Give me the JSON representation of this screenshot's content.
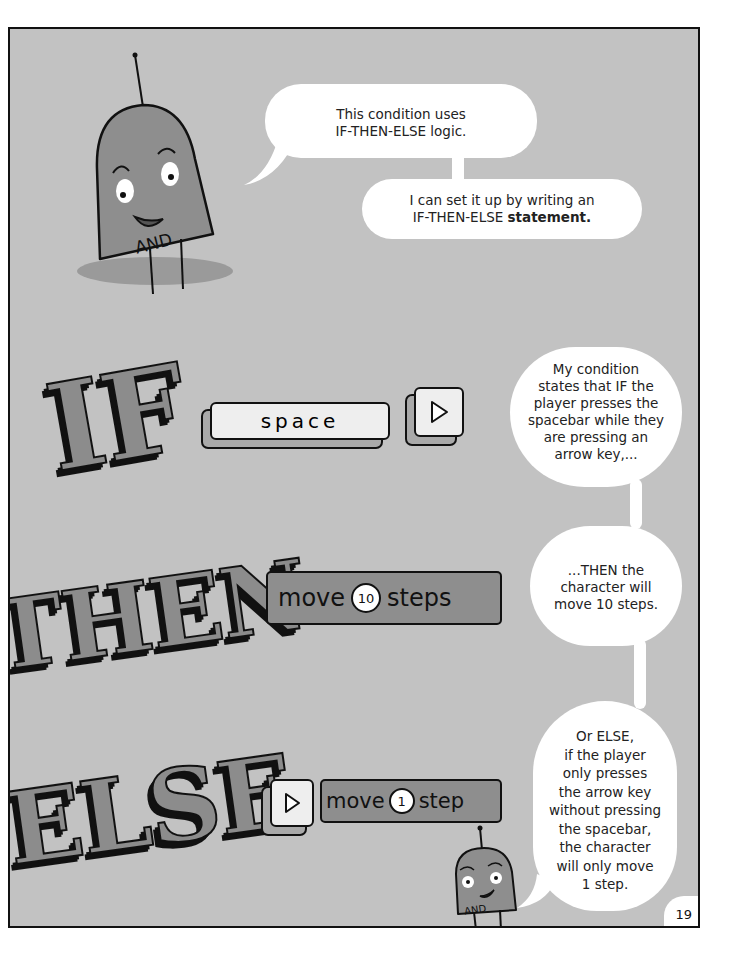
{
  "page": {
    "number": "19",
    "colors": {
      "panel_bg": "#c2c2c2",
      "border": "#111111",
      "bubble": "#ffffff",
      "robot": "#8e8e8e",
      "letters": "#8c8c8c"
    }
  },
  "top": {
    "robot_label": "AND",
    "bubble1": {
      "line1": "This condition uses",
      "line2": "IF-THEN-ELSE logic."
    },
    "bubble2": {
      "line1": "I can set it up by writing an",
      "line2_prefix": "IF-THEN-ELSE ",
      "line2_bold": "statement."
    }
  },
  "rows": {
    "if": {
      "word": "IF",
      "space_key_label": "space",
      "arrow_key_icon": "right-arrow-key-icon",
      "bubble": [
        "My condition",
        "states that IF the",
        "player presses the",
        "spacebar while they",
        "are pressing an",
        "arrow key,..."
      ]
    },
    "then": {
      "word": "THEN",
      "block_prefix": "move",
      "block_number": "10",
      "block_suffix": "steps",
      "bubble": [
        "...THEN the",
        "character will",
        "move 10 steps."
      ]
    },
    "else": {
      "word": "ELSE",
      "arrow_key_icon": "right-arrow-key-icon",
      "block_prefix": "move",
      "block_number": "1",
      "block_suffix": "step",
      "robot_label": "AND",
      "bubble": [
        "Or ELSE,",
        "if the player",
        "only presses",
        "the arrow key",
        "without pressing",
        "the spacebar,",
        "the character",
        "will only move",
        "1 step."
      ]
    }
  }
}
